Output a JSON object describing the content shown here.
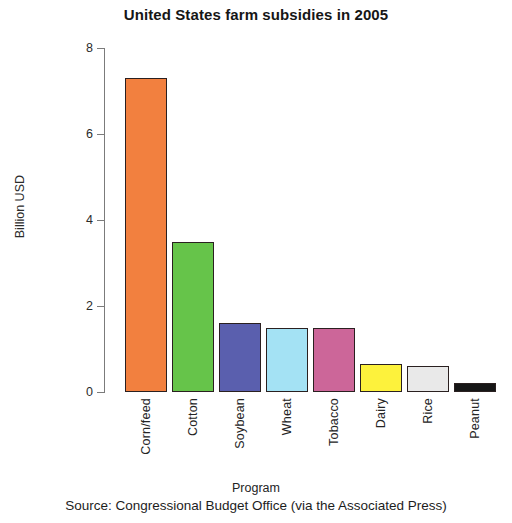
{
  "chart_data": {
    "type": "bar",
    "title": "United States farm subsidies in 2005",
    "xlabel": "Program",
    "ylabel": "Billion USD",
    "categories": [
      "Corn/feed",
      "Cotton",
      "Soybean",
      "Wheat",
      "Tobacco",
      "Dairy",
      "Rice",
      "Peanut"
    ],
    "values": [
      7.3,
      3.5,
      1.6,
      1.5,
      1.5,
      0.65,
      0.6,
      0.2
    ],
    "colors": [
      "#F2803F",
      "#66C council",
      "#5A5FAE",
      "#A4E2F4",
      "#CC6699",
      "#FDF23C",
      "#E9E9E9",
      "#161616"
    ],
    "bar_colors": [
      "#F2803F",
      "#66C44A",
      "#5A5FAE",
      "#A4E2F4",
      "#CC6699",
      "#FDF23C",
      "#E9E9E9",
      "#161616"
    ],
    "bar_edge_color": "#2A2020",
    "ylim": [
      0,
      8
    ],
    "yticks": [
      0,
      2,
      4,
      6,
      8
    ],
    "ytick_labels": [
      "0",
      "2",
      "4",
      "6",
      "8"
    ],
    "grid": false,
    "legend": "none",
    "annotations": [
      "Source:  Congressional Budget Office (via the Associated Press)"
    ]
  },
  "caption": {
    "source_text": "Source:  Congressional Budget Office (via the Associated Press)"
  }
}
